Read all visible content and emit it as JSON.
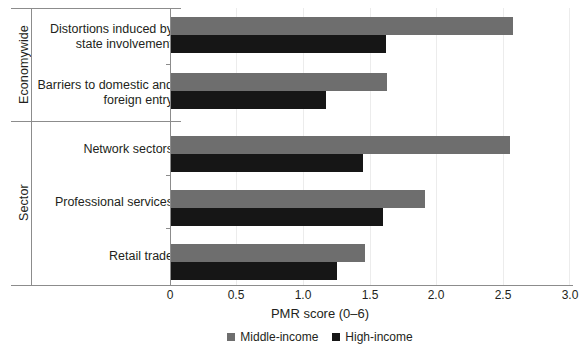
{
  "chart_data": {
    "type": "bar",
    "orientation": "horizontal",
    "title": "",
    "xlabel": "PMR score (0–6)",
    "ylabel": "",
    "xlim": [
      0,
      3.0
    ],
    "xticks": [
      "0",
      "0.5",
      "1.0",
      "1.5",
      "2.0",
      "2.5",
      "3.0"
    ],
    "grid": true,
    "legend_position": "bottom",
    "categories": [
      "Distortions induced by\nstate involvement",
      "Barriers to domestic and\nforeign entry",
      "Network sectors",
      "Professional services",
      "Retail trade"
    ],
    "category_groups": [
      {
        "name": "Economywide",
        "categories": [
          "Distortions induced by\nstate involvement",
          "Barriers to domestic and\nforeign entry"
        ]
      },
      {
        "name": "Sector",
        "categories": [
          "Network sectors",
          "Professional services",
          "Retail trade"
        ]
      }
    ],
    "series": [
      {
        "name": "Middle-income",
        "color": "#6e6e6e",
        "values": [
          2.57,
          1.63,
          2.55,
          1.91,
          1.46
        ]
      },
      {
        "name": "High-income",
        "color": "#161616",
        "values": [
          1.62,
          1.17,
          1.45,
          1.6,
          1.25
        ]
      }
    ]
  },
  "legend": {
    "items": [
      {
        "label": "Middle-income",
        "color": "#6e6e6e"
      },
      {
        "label": "High-income",
        "color": "#161616"
      }
    ]
  },
  "axis": {
    "x_title": "PMR score (0–6)"
  }
}
